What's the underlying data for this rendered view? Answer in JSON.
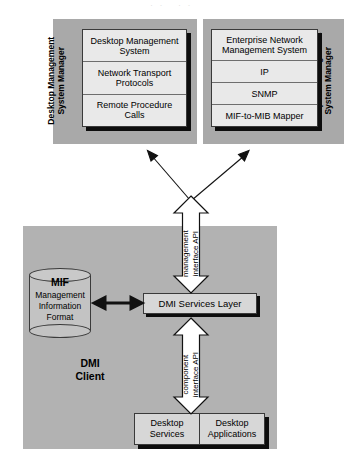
{
  "diagram": {
    "colors": {
      "panel_gray": "#a9a9a9",
      "client_gray": "#b2b2b2",
      "box_light": "#e9e9e9",
      "box_mid": "#d7d7d7",
      "cylinder": "#c3c3c3",
      "shadow": "#0d0d0d",
      "stroke": "#3a3a3a"
    },
    "top_panels": [
      {
        "id": "desktop-management-system-manager",
        "side_label": "Desktop Management\nSystem Manager",
        "rows": [
          "Desktop Management\nSystem",
          "Network Transport\nProtocols",
          "Remote Procedure\nCalls"
        ]
      },
      {
        "id": "enterprise-management-system-manager",
        "side_label": "Enterprise Management\nSystem Manager",
        "rows": [
          "Enterprise Network\nManagement System",
          "IP",
          "SNMP",
          "MIF-to-MIB Mapper"
        ]
      }
    ],
    "client": {
      "label": "DMI\nClient",
      "mif": {
        "title": "MIF",
        "subtitle": "Management\nInformation\nFormat"
      },
      "services_layer": "DMI Services Layer",
      "bottom_boxes": [
        "Desktop\nServices",
        "Desktop\nApplications"
      ]
    },
    "arrows": {
      "management_api": "management\ninterface API",
      "component_api": "component\ninterface API",
      "mif_link": "bidirectional-arrow",
      "to_managers": "two-diagonal-arrows-up"
    }
  }
}
